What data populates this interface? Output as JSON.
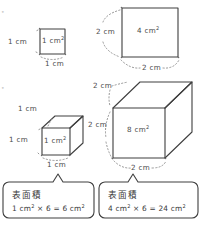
{
  "figure": {
    "kind": "surface-area-diagram",
    "language": "ja",
    "stroke_color": "#3f3f3f",
    "text_color": "#3a3a3a",
    "background": "#ffffff"
  },
  "row1": {
    "small_square": {
      "face_label": "1 cm",
      "face_label_sup": "2",
      "left_label": "1 cm",
      "bottom_label": "1 cm"
    },
    "large_square": {
      "face_label": "4 cm",
      "face_label_sup": "2",
      "left_label": "2 cm",
      "bottom_label": "2 cm"
    }
  },
  "row2": {
    "small_cube": {
      "face_label": "1 cm",
      "face_label_sup": "2",
      "top_label": "1 cm",
      "left_label": "1 cm",
      "bottom_label": "1 cm"
    },
    "large_cube": {
      "face_label": "8 cm",
      "face_label_sup": "2",
      "top_label": "2 cm",
      "left_label": "2 cm",
      "bottom_label": "2 cm"
    }
  },
  "callouts": [
    {
      "title": "表面積",
      "formula_pre": "1 cm",
      "formula_sup1": "2",
      "formula_mid": " × 6 = 6 cm",
      "formula_sup2": "2"
    },
    {
      "title": "表面積",
      "formula_pre": "4 cm",
      "formula_sup1": "2",
      "formula_mid": " × 6 = 24 cm",
      "formula_sup2": "2"
    }
  ],
  "edge_marks": {
    "top": "•",
    "bottom": "•"
  }
}
